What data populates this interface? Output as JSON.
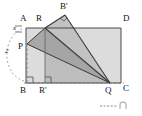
{
  "figure": {
    "type": "geometry-diagram",
    "background_color": "#ffffff",
    "stroke_color": "#3a3a3a",
    "dash_color": "#7a7a7a",
    "fill_light": "#d0d0d0",
    "fill_mid": "#b6b6b6",
    "fill_dark": "#9a9a9a"
  },
  "vertices": {
    "A": {
      "label": "A",
      "x": 26,
      "y": 28
    },
    "B": {
      "label": "B",
      "x": 26,
      "y": 83
    },
    "C": {
      "label": "C",
      "x": 121,
      "y": 83
    },
    "D": {
      "label": "D",
      "x": 121,
      "y": 28
    },
    "R": {
      "label": "R",
      "x": 45,
      "y": 28
    },
    "Rp": {
      "label": "R'",
      "x": 45,
      "y": 83
    },
    "P": {
      "label": "P",
      "x": 27,
      "y": 44
    },
    "Q": {
      "label": "Q",
      "x": 110,
      "y": 83
    },
    "Bp": {
      "label": "B'",
      "x": 65,
      "y": 15
    }
  },
  "labels": [
    {
      "name": "vertex-label-A",
      "text": "A",
      "x": 20,
      "y": 16
    },
    {
      "name": "vertex-label-R",
      "text": "R",
      "x": 36,
      "y": 16
    },
    {
      "name": "vertex-label-B-prime",
      "text": "B'",
      "x": 60,
      "y": 3
    },
    {
      "name": "vertex-label-D",
      "text": "D",
      "x": 122,
      "y": 16
    },
    {
      "name": "vertex-label-P",
      "text": "P",
      "x": 17,
      "y": 43
    },
    {
      "name": "vertex-label-B",
      "text": "B",
      "x": 19,
      "y": 87
    },
    {
      "name": "vertex-label-R-prime",
      "text": "R'",
      "x": 39,
      "y": 87
    },
    {
      "name": "vertex-label-Q",
      "text": "Q",
      "x": 106,
      "y": 87
    },
    {
      "name": "vertex-label-C",
      "text": "C",
      "x": 122,
      "y": 85
    }
  ],
  "measures": [
    {
      "name": "measure-x",
      "text": "x",
      "x": 12,
      "y": 29
    },
    {
      "name": "measure-2",
      "text": "2",
      "x": 6,
      "y": 50
    }
  ],
  "watermark": {
    "name": "watermark-mark",
    "visible": true,
    "x": 102,
    "y": 103
  }
}
